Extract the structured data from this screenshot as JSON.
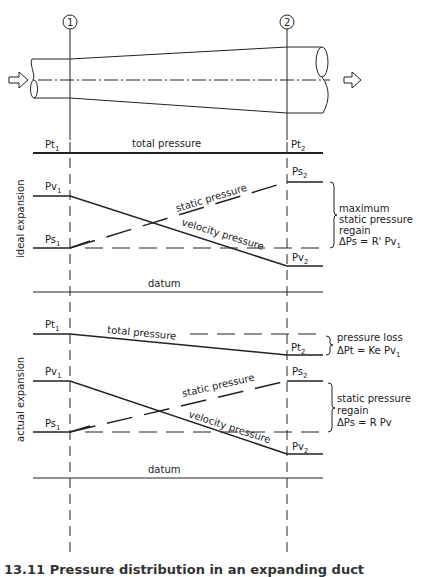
{
  "figure": {
    "section_markers": [
      "1",
      "2"
    ],
    "ideal": {
      "side_label": "ideal expansion",
      "labels": {
        "pt1": "Pt",
        "pt1_sub": "1",
        "pt2": "Pt",
        "pt2_sub": "2",
        "pv1": "Pv",
        "pv1_sub": "1",
        "ps1": "Ps",
        "ps1_sub": "1",
        "ps2": "Ps",
        "ps2_sub": "2",
        "pv2": "Pv",
        "pv2_sub": "2"
      },
      "total_pressure": "total pressure",
      "static_pressure": "static pressure",
      "velocity_pressure": "velocity pressure",
      "datum": "datum",
      "annotation": [
        "maximum",
        "static pressure",
        "regain",
        "ΔPs = R' Pv"
      ],
      "annotation_sub": "1"
    },
    "actual": {
      "side_label": "actual expansion",
      "labels": {
        "pt1": "Pt",
        "pt1_sub": "1",
        "pt2": "Pt",
        "pt2_sub": "2",
        "pv1": "Pv",
        "pv1_sub": "1",
        "ps1": "Ps",
        "ps1_sub": "1",
        "ps2": "Ps",
        "ps2_sub": "2",
        "pv2": "Pv",
        "pv2_sub": "2"
      },
      "total_pressure": "total pressure",
      "static_pressure": "static pressure",
      "velocity_pressure": "velocity pressure",
      "datum": "datum",
      "loss_annotation": [
        "pressure loss",
        "ΔPt = Ke Pv"
      ],
      "loss_annotation_sub": "1",
      "regain_annotation": [
        "static pressure",
        "regain",
        "ΔPs = R Pv"
      ]
    },
    "caption": "13.11 Pressure distribution in an expanding duct"
  }
}
